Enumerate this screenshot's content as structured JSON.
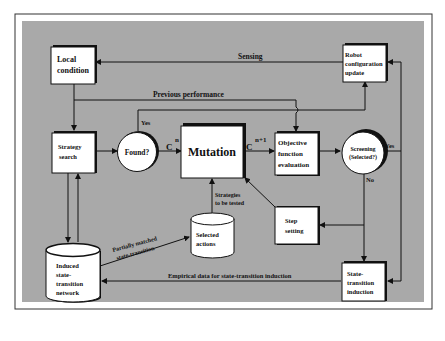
{
  "diagram": {
    "colors": {
      "background": "#ffffff",
      "panel": "#a9a9a9",
      "node_fill": "#ffffff",
      "stroke": "#111111"
    },
    "nodes": {
      "local_condition": {
        "line1": "Local",
        "line2": "condition",
        "shape": "box"
      },
      "robot_update": {
        "line1": "Robot",
        "line2": "configuration",
        "line3": "update",
        "shape": "box"
      },
      "strategy_search": {
        "line1": "Strategy",
        "line2": "search",
        "shape": "box"
      },
      "found": {
        "label": "Found?",
        "shape": "circle"
      },
      "mutation": {
        "label": "Mutation",
        "shape": "box"
      },
      "objective": {
        "line1": "Objective",
        "line2": "function",
        "line3": "evaluation",
        "shape": "box"
      },
      "screening": {
        "line1": "Screening",
        "line2": "(Selected?)",
        "shape": "circle"
      },
      "step_setting": {
        "line1": "Step",
        "line2": "setting",
        "shape": "box"
      },
      "selected_actions": {
        "line1": "Selected",
        "line2": "actions",
        "shape": "cylinder"
      },
      "induced_network": {
        "line1": "Induced",
        "line2": "state-",
        "line3": "transition",
        "line4": "network",
        "shape": "cylinder"
      },
      "state_transition_induction": {
        "line1": "State-",
        "line2": "transition",
        "line3": "induction",
        "shape": "box"
      }
    },
    "edge_labels": {
      "sensing": "Sensing",
      "previous_performance": "Previous performance",
      "yes_found": "Yes",
      "c_n_base": "C",
      "c_n_sup": "n",
      "c_n1_base": "C",
      "c_n1_sup": "n+1",
      "yes_screening": "Yes",
      "no_screening": "No",
      "strategies_line1": "Strategies",
      "strategies_line2": "to be tested",
      "partially_line1": "Partially matched",
      "partially_line2": "state-transition",
      "empirical": "Empirical data for state-transition induction"
    }
  }
}
